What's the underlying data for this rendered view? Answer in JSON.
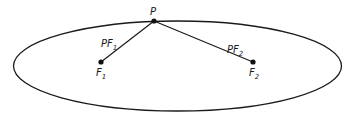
{
  "diagram": {
    "ellipse": {
      "cx": 177.5,
      "cy": 66,
      "rx": 164,
      "ry": 45,
      "stroke": "#1a1a1a"
    },
    "point_p": {
      "x": 154,
      "y": 21,
      "label": "P"
    },
    "focus_1": {
      "x": 101,
      "y": 62,
      "label": "F",
      "sub": "1"
    },
    "focus_2": {
      "x": 253,
      "y": 62,
      "label": "F",
      "sub": "2"
    },
    "segment_1": {
      "label": "PF",
      "sub": "1"
    },
    "segment_2": {
      "label": "PF",
      "sub": "2"
    }
  }
}
